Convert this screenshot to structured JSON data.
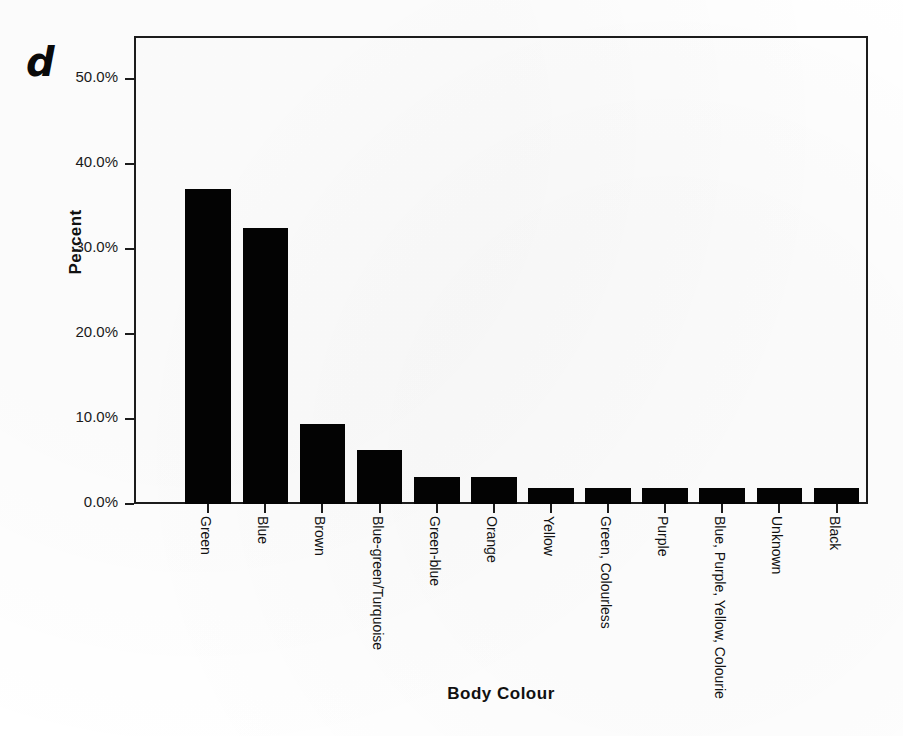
{
  "panel": {
    "letter": "d"
  },
  "chart_data": {
    "type": "bar",
    "title": "",
    "xlabel": "Body Colour",
    "ylabel": "Percent",
    "ylim": [
      0,
      55
    ],
    "grid": false,
    "legend": "none",
    "orientation": "vertical",
    "bar_color": "#030303",
    "categories": [
      "Green",
      "Blue",
      "Brown",
      "Blue-green/Turquoise",
      "Green-blue",
      "Orange",
      "Yellow",
      "Green, Colourless",
      "Purple",
      "Blue, Purple, Yellow, Colourie",
      "Unknown",
      "Black"
    ],
    "values": [
      37.0,
      32.4,
      9.4,
      6.4,
      3.2,
      3.2,
      1.9,
      1.9,
      1.9,
      1.9,
      1.9,
      1.9
    ],
    "value_labels": [
      "37.0%",
      "32.4%",
      "9.4%",
      "6.4%",
      "3.2%",
      "3.2%",
      "1.9%",
      "1.9%",
      "1.9%",
      "1.9%",
      "1.9%",
      "1.9%"
    ],
    "yticks": [
      0,
      10,
      20,
      30,
      40,
      50
    ],
    "ytick_labels": [
      "0.0%",
      "10.0%",
      "20.0%",
      "30.0%",
      "40.0%",
      "50.0%"
    ]
  }
}
